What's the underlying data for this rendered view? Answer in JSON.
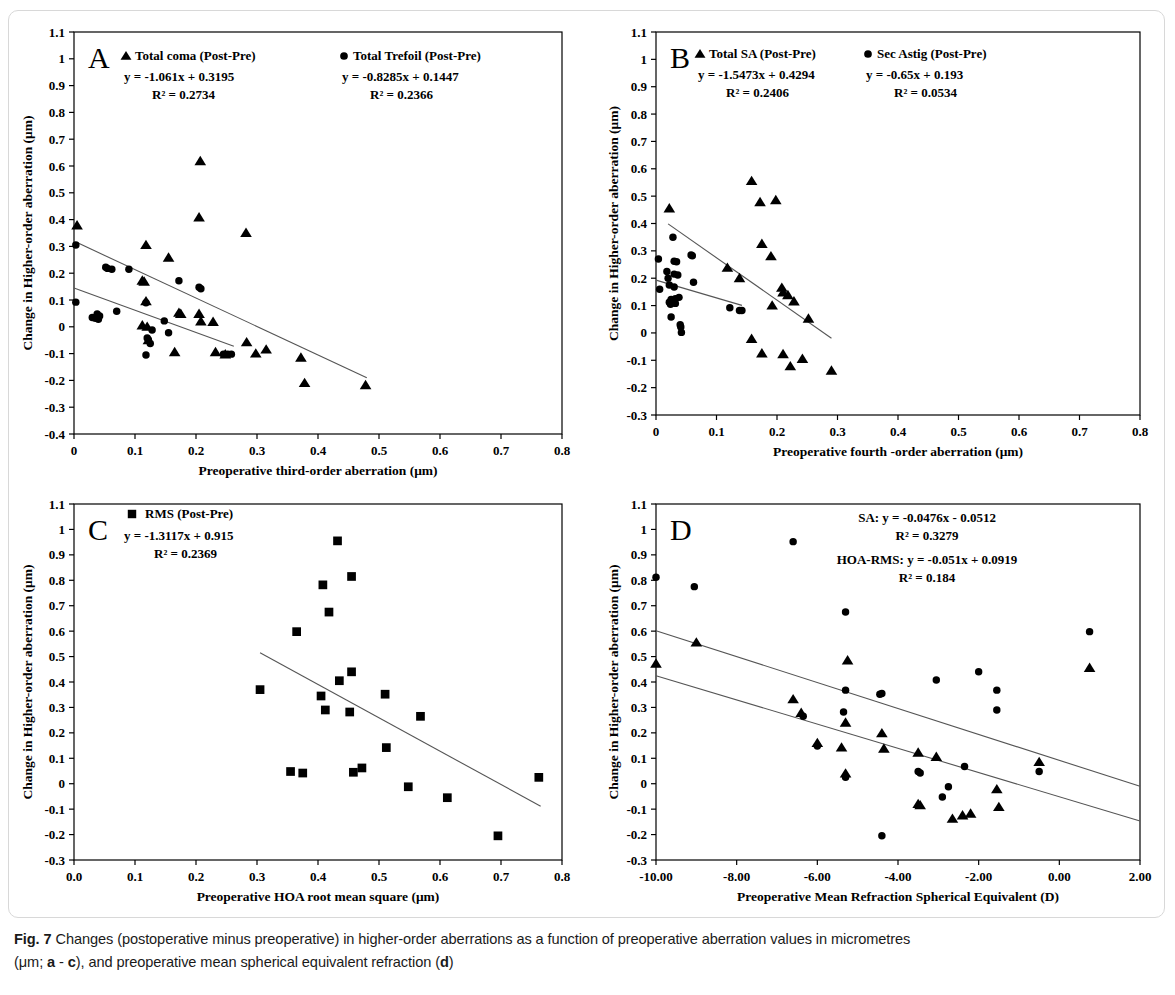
{
  "figure": {
    "caption_label": "Fig. 7",
    "caption_line1": "Changes (postoperative minus preoperative) in higher-order aberrations as a function of preoperative aberration values in micrometres",
    "caption_line2_pre": "(μm; ",
    "caption_ref_a": "a",
    "caption_dash": " - ",
    "caption_ref_c": "c",
    "caption_line2_mid": "), and preoperative mean spherical equivalent refraction (",
    "caption_ref_d": "d",
    "caption_line2_end": ")"
  },
  "chart_data": [
    {
      "type": "scatter",
      "panel": "A",
      "panel_letter": "A",
      "title": "",
      "xlabel": "Preoperative third-order  aberration  (μm)",
      "ylabel": "Change in Higher-order  aberration  (μm)",
      "xlim": [
        0,
        0.8
      ],
      "ylim": [
        -0.4,
        1.1
      ],
      "xticks": [
        0,
        0.1,
        0.2,
        0.3,
        0.4,
        0.5,
        0.6,
        0.7,
        0.8
      ],
      "xtick_labels": [
        "0",
        "0.1",
        "0.2",
        "0.3",
        "0.4",
        "0.5",
        "0.6",
        "0.7",
        "0.8"
      ],
      "yticks": [
        -0.4,
        -0.3,
        -0.2,
        -0.1,
        0,
        0.1,
        0.2,
        0.3,
        0.4,
        0.5,
        0.6,
        0.7,
        0.8,
        0.9,
        1.0,
        1.1
      ],
      "ytick_labels": [
        "-0.4",
        "-0.3",
        "-0.2",
        "-0.1",
        "0",
        "0.1",
        "0.2",
        "0.3",
        "0.4",
        "0.5",
        "0.6",
        "0.7",
        "0.8",
        "0.9",
        "1",
        "1.1"
      ],
      "grid": false,
      "legend_position": "top-inside",
      "series": [
        {
          "name": "Total coma (Post-Pre)",
          "marker": "triangle",
          "equation": "y = -1.061x + 0.3195",
          "r2": "R² = 0.2734",
          "slope": -1.061,
          "intercept": 0.3195,
          "fit_xrange": [
            0.005,
            0.48
          ],
          "points": [
            [
              0.005,
              0.378
            ],
            [
              0.112,
              0.172
            ],
            [
              0.115,
              0.168
            ],
            [
              0.118,
              0.305
            ],
            [
              0.118,
              0.095
            ],
            [
              0.112,
              0.005
            ],
            [
              0.12,
              0.0
            ],
            [
              0.122,
              -0.05
            ],
            [
              0.155,
              0.258
            ],
            [
              0.165,
              -0.095
            ],
            [
              0.172,
              0.052
            ],
            [
              0.175,
              0.048
            ],
            [
              0.205,
              0.408
            ],
            [
              0.205,
              0.048
            ],
            [
              0.208,
              0.02
            ],
            [
              0.207,
              0.618
            ],
            [
              0.228,
              0.018
            ],
            [
              0.232,
              -0.095
            ],
            [
              0.248,
              -0.103
            ],
            [
              0.282,
              0.35
            ],
            [
              0.283,
              -0.058
            ],
            [
              0.298,
              -0.1
            ],
            [
              0.315,
              -0.085
            ],
            [
              0.372,
              -0.115
            ],
            [
              0.378,
              -0.21
            ],
            [
              0.478,
              -0.218
            ]
          ]
        },
        {
          "name": "Total Trefoil (Post-Pre)",
          "marker": "circle",
          "equation": "y = -0.8285x + 0.1447",
          "r2": "R² = 0.2366",
          "slope": -0.8285,
          "intercept": 0.1447,
          "fit_xrange": [
            0.0,
            0.262
          ],
          "points": [
            [
              0.003,
              0.305
            ],
            [
              0.003,
              0.092
            ],
            [
              0.03,
              0.035
            ],
            [
              0.035,
              0.032
            ],
            [
              0.038,
              0.048
            ],
            [
              0.04,
              0.028
            ],
            [
              0.042,
              0.04
            ],
            [
              0.052,
              0.222
            ],
            [
              0.055,
              0.218
            ],
            [
              0.062,
              0.215
            ],
            [
              0.07,
              0.058
            ],
            [
              0.09,
              0.215
            ],
            [
              0.118,
              0.09
            ],
            [
              0.12,
              -0.042
            ],
            [
              0.122,
              -0.048
            ],
            [
              0.125,
              -0.062
            ],
            [
              0.118,
              -0.105
            ],
            [
              0.128,
              -0.012
            ],
            [
              0.148,
              0.022
            ],
            [
              0.155,
              -0.022
            ],
            [
              0.172,
              0.172
            ],
            [
              0.205,
              0.148
            ],
            [
              0.208,
              0.142
            ],
            [
              0.245,
              -0.102
            ],
            [
              0.252,
              -0.102
            ],
            [
              0.258,
              -0.102
            ]
          ]
        }
      ]
    },
    {
      "type": "scatter",
      "panel": "B",
      "panel_letter": "B",
      "title": "",
      "xlabel": "Preoperative fourth -order aberration  (μm)",
      "ylabel": "Change in Higher-order  aberration  (μm)",
      "xlim": [
        0,
        0.8
      ],
      "ylim": [
        -0.3,
        1.1
      ],
      "xticks": [
        0,
        0.1,
        0.2,
        0.3,
        0.4,
        0.5,
        0.6,
        0.7,
        0.8
      ],
      "xtick_labels": [
        "0",
        "0.1",
        "0.2",
        "0.3",
        "0.4",
        "0.5",
        "0.6",
        "0.7",
        "0.8"
      ],
      "yticks": [
        -0.3,
        -0.2,
        -0.1,
        0,
        0.1,
        0.2,
        0.3,
        0.4,
        0.5,
        0.6,
        0.7,
        0.8,
        0.9,
        1.0,
        1.1
      ],
      "ytick_labels": [
        "-0.3",
        "-0.2",
        "-0.1",
        "0",
        "0.1",
        "0.2",
        "0.3",
        "0.4",
        "0.5",
        "0.6",
        "0.7",
        "0.8",
        "0.9",
        "1",
        "1.1"
      ],
      "grid": false,
      "legend_position": "top-inside",
      "series": [
        {
          "name": "Total SA (Post-Pre)",
          "marker": "triangle",
          "equation": "y = -1.5473x + 0.4294",
          "r2": "R² = 0.2406",
          "slope": -1.5473,
          "intercept": 0.4294,
          "fit_xrange": [
            0.02,
            0.29
          ],
          "points": [
            [
              0.022,
              0.455
            ],
            [
              0.118,
              0.238
            ],
            [
              0.138,
              0.2
            ],
            [
              0.158,
              0.555
            ],
            [
              0.158,
              -0.022
            ],
            [
              0.172,
              0.478
            ],
            [
              0.175,
              0.325
            ],
            [
              0.175,
              -0.075
            ],
            [
              0.19,
              0.28
            ],
            [
              0.192,
              0.1
            ],
            [
              0.198,
              0.485
            ],
            [
              0.208,
              0.165
            ],
            [
              0.21,
              0.148
            ],
            [
              0.21,
              -0.078
            ],
            [
              0.218,
              0.138
            ],
            [
              0.222,
              -0.122
            ],
            [
              0.228,
              0.115
            ],
            [
              0.242,
              -0.095
            ],
            [
              0.252,
              0.052
            ],
            [
              0.29,
              -0.138
            ]
          ]
        },
        {
          "name": "Sec Astig (Post-Pre)",
          "marker": "circle",
          "equation": "y = -0.65x + 0.193",
          "r2": "R² = 0.0534",
          "slope": -0.65,
          "intercept": 0.193,
          "fit_xrange": [
            0.0,
            0.142
          ],
          "points": [
            [
              0.004,
              0.27
            ],
            [
              0.006,
              0.16
            ],
            [
              0.018,
              0.225
            ],
            [
              0.02,
              0.2
            ],
            [
              0.022,
              0.175
            ],
            [
              0.022,
              0.112
            ],
            [
              0.024,
              0.105
            ],
            [
              0.025,
              0.122
            ],
            [
              0.025,
              0.058
            ],
            [
              0.028,
              0.35
            ],
            [
              0.03,
              0.262
            ],
            [
              0.03,
              0.215
            ],
            [
              0.03,
              0.168
            ],
            [
              0.032,
              0.125
            ],
            [
              0.032,
              0.108
            ],
            [
              0.034,
              0.26
            ],
            [
              0.036,
              0.212
            ],
            [
              0.038,
              0.13
            ],
            [
              0.04,
              0.03
            ],
            [
              0.041,
              0.022
            ],
            [
              0.042,
              0.002
            ],
            [
              0.058,
              0.285
            ],
            [
              0.06,
              0.282
            ],
            [
              0.062,
              0.185
            ],
            [
              0.122,
              0.092
            ],
            [
              0.138,
              0.082
            ],
            [
              0.142,
              0.082
            ]
          ]
        }
      ]
    },
    {
      "type": "scatter",
      "panel": "C",
      "panel_letter": "C",
      "title": "",
      "xlabel": "Preoperative HOA root mean square (μm)",
      "ylabel": "Change in Higher-order  aberration  (μm)",
      "xlim": [
        0,
        0.8
      ],
      "ylim": [
        -0.3,
        1.1
      ],
      "xticks": [
        0,
        0.1,
        0.2,
        0.3,
        0.4,
        0.5,
        0.6,
        0.7,
        0.8
      ],
      "xtick_labels": [
        "0.0",
        "0.1",
        "0.2",
        "0.3",
        "0.4",
        "0.5",
        "0.6",
        "0.7",
        "0.8"
      ],
      "yticks": [
        -0.3,
        -0.2,
        -0.1,
        0,
        0.1,
        0.2,
        0.3,
        0.4,
        0.5,
        0.6,
        0.7,
        0.8,
        0.9,
        1.0,
        1.1
      ],
      "ytick_labels": [
        "-0.3",
        "-0.2",
        "-0.1",
        "0",
        "0.1",
        "0.2",
        "0.3",
        "0.4",
        "0.5",
        "0.6",
        "0.7",
        "0.8",
        "0.9",
        "1",
        "1.1"
      ],
      "grid": false,
      "legend_position": "top-inside",
      "series": [
        {
          "name": "RMS (Post-Pre)",
          "marker": "square",
          "equation": "y = -1.3117x + 0.915",
          "r2": "R² = 0.2369",
          "slope": -1.3117,
          "intercept": 0.915,
          "fit_xrange": [
            0.305,
            0.765
          ],
          "points": [
            [
              0.305,
              0.37
            ],
            [
              0.355,
              0.048
            ],
            [
              0.365,
              0.598
            ],
            [
              0.375,
              0.042
            ],
            [
              0.405,
              0.345
            ],
            [
              0.408,
              0.782
            ],
            [
              0.412,
              0.29
            ],
            [
              0.418,
              0.675
            ],
            [
              0.432,
              0.955
            ],
            [
              0.435,
              0.405
            ],
            [
              0.452,
              0.282
            ],
            [
              0.455,
              0.44
            ],
            [
              0.455,
              0.815
            ],
            [
              0.458,
              0.045
            ],
            [
              0.472,
              0.062
            ],
            [
              0.51,
              0.352
            ],
            [
              0.512,
              0.142
            ],
            [
              0.548,
              -0.012
            ],
            [
              0.568,
              0.265
            ],
            [
              0.612,
              -0.055
            ],
            [
              0.695,
              -0.205
            ],
            [
              0.762,
              0.025
            ]
          ]
        }
      ]
    },
    {
      "type": "scatter",
      "panel": "D",
      "panel_letter": "D",
      "title": "",
      "xlabel": "Preoperative  Mean Refraction  Spherical  Equivalent  (D)",
      "ylabel": "Change in Higher-order  aberration  (μm)",
      "xlim": [
        -10,
        2
      ],
      "ylim": [
        -0.3,
        1.1
      ],
      "xticks": [
        -10,
        -8,
        -6,
        -4,
        -2,
        0,
        2
      ],
      "xtick_labels": [
        "-10.00",
        "-8.00",
        "-6.00",
        "-4.00",
        "-2.00",
        "0.00",
        "2.00"
      ],
      "yticks": [
        -0.3,
        -0.2,
        -0.1,
        0,
        0.1,
        0.2,
        0.3,
        0.4,
        0.5,
        0.6,
        0.7,
        0.8,
        0.9,
        1.0,
        1.1
      ],
      "ytick_labels": [
        "-0.3",
        "-0.2",
        "-0.1",
        "0",
        "0.1",
        "0.2",
        "0.3",
        "0.4",
        "0.5",
        "0.6",
        "0.7",
        "0.8",
        "0.9",
        "1",
        "1.1"
      ],
      "grid": false,
      "legend_position": "top-inside",
      "series": [
        {
          "name": "SA",
          "marker": "triangle",
          "equation": "SA: y = -0.0476x - 0.0512",
          "r2": "R² = 0.3279",
          "slope": -0.0476,
          "intercept": -0.0512,
          "fit_xrange": [
            -10,
            2
          ],
          "points": [
            [
              -10.0,
              0.472
            ],
            [
              -9.0,
              0.555
            ],
            [
              -6.6,
              0.332
            ],
            [
              -6.4,
              0.278
            ],
            [
              -6.0,
              0.16
            ],
            [
              -5.4,
              0.142
            ],
            [
              -5.25,
              0.485
            ],
            [
              -5.3,
              0.24
            ],
            [
              -5.3,
              0.04
            ],
            [
              -4.4,
              0.198
            ],
            [
              -4.35,
              0.138
            ],
            [
              -3.5,
              0.122
            ],
            [
              -3.5,
              -0.08
            ],
            [
              -3.45,
              -0.085
            ],
            [
              -3.05,
              0.105
            ],
            [
              -2.65,
              -0.138
            ],
            [
              -2.4,
              -0.125
            ],
            [
              -2.2,
              -0.118
            ],
            [
              -1.55,
              -0.022
            ],
            [
              -1.5,
              -0.092
            ],
            [
              -0.5,
              0.085
            ],
            [
              0.75,
              0.455
            ]
          ]
        },
        {
          "name": "HOA-RMS",
          "marker": "circle",
          "equation": "HOA-RMS: y = -0.051x + 0.0919",
          "r2": "R² = 0.184",
          "slope": -0.051,
          "intercept": 0.0919,
          "fit_xrange": [
            -10,
            2
          ],
          "points": [
            [
              -10.0,
              0.812
            ],
            [
              -9.05,
              0.775
            ],
            [
              -6.6,
              0.952
            ],
            [
              -6.35,
              0.265
            ],
            [
              -6.0,
              0.148
            ],
            [
              -5.3,
              0.675
            ],
            [
              -5.3,
              0.368
            ],
            [
              -5.35,
              0.282
            ],
            [
              -5.3,
              0.025
            ],
            [
              -4.45,
              0.352
            ],
            [
              -4.4,
              0.355
            ],
            [
              -4.4,
              -0.205
            ],
            [
              -3.5,
              0.048
            ],
            [
              -3.45,
              0.042
            ],
            [
              -3.05,
              0.408
            ],
            [
              -2.75,
              -0.012
            ],
            [
              -2.9,
              -0.052
            ],
            [
              -2.35,
              0.068
            ],
            [
              -2.0,
              0.44
            ],
            [
              -1.55,
              0.368
            ],
            [
              -1.55,
              0.29
            ],
            [
              -0.5,
              0.048
            ],
            [
              0.75,
              0.598
            ]
          ]
        }
      ]
    }
  ]
}
